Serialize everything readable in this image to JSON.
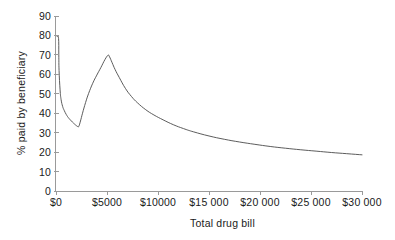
{
  "chart_data": {
    "type": "line",
    "title": "",
    "subtitle": "",
    "xlabel": "Total drug bill",
    "ylabel": "% paid by beneficiary",
    "xlim": [
      0,
      30000
    ],
    "ylim": [
      0,
      90
    ],
    "grid": false,
    "legend": null,
    "legend_position": "none",
    "line_color": "#4a4a4a",
    "axis_color": "#9a9a9a",
    "text_color": "#1a1a1a",
    "background_color": "#ffffff",
    "x_ticks": [
      0,
      5000,
      10000,
      15000,
      20000,
      25000,
      30000
    ],
    "x_tick_labels": [
      "$0",
      "$5000",
      "$10000",
      "$15 000",
      "$20 000",
      "$25 000",
      "$30 000"
    ],
    "y_ticks": [
      0,
      10,
      20,
      30,
      40,
      50,
      60,
      70,
      80,
      90
    ],
    "y_tick_labels": [
      "0",
      "10",
      "20",
      "30",
      "40",
      "50",
      "60",
      "70",
      "80",
      "90"
    ],
    "series": [
      {
        "name": "% paid by beneficiary",
        "x": [
          0,
          120,
          250,
          275,
          300,
          400,
          500,
          650,
          800,
          1000,
          1200,
          1400,
          1600,
          1800,
          2000,
          2150,
          2250,
          2400,
          2600,
          2900,
          3200,
          3600,
          4000,
          4400,
          4800,
          5100,
          5250,
          5500,
          5800,
          6200,
          6800,
          7400,
          8000,
          8800,
          9600,
          10500,
          11500,
          12500,
          13500,
          15000,
          16500,
          18000,
          19500,
          21000,
          22500,
          24000,
          25500,
          27000,
          28500,
          30000
        ],
        "y": [
          80,
          79.5,
          78.5,
          70,
          62,
          52,
          47,
          43.5,
          41.5,
          39.4,
          37.8,
          36.6,
          35.5,
          34.5,
          33.6,
          33.1,
          33.4,
          36,
          40,
          45.5,
          50.2,
          55.4,
          59.6,
          63.5,
          67.6,
          69.8,
          69,
          66,
          62.4,
          58.4,
          52.8,
          48.6,
          45.3,
          41.8,
          39.1,
          36.6,
          34.1,
          32.1,
          30.4,
          28.3,
          26.6,
          25.2,
          24,
          22.9,
          22,
          21.2,
          20.5,
          19.8,
          19.2,
          18.6
        ]
      }
    ],
    "annotations": [
      {
        "label": "initial deductible drop",
        "x": 275,
        "y": 80
      },
      {
        "label": "local minimum",
        "x": 2200,
        "y": 33
      },
      {
        "label": "coverage gap peak",
        "x": 5100,
        "y": 70
      },
      {
        "label": "catastrophic tail",
        "x": 30000,
        "y": 16
      }
    ]
  },
  "figure": {
    "x_axis_title": "Total drug bill",
    "y_axis_title": "% paid by beneficiary"
  }
}
